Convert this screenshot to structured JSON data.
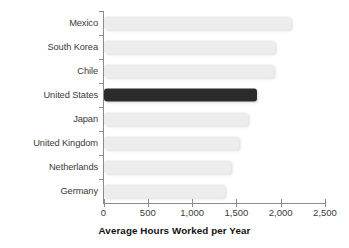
{
  "chart_data": {
    "type": "bar",
    "orientation": "horizontal",
    "title": "",
    "xlabel": "Average Hours Worked per Year",
    "ylabel": "",
    "categories": [
      "Mexico",
      "South Korea",
      "Chile",
      "United States",
      "Japan",
      "United Kingdom",
      "Netherlands",
      "Germany"
    ],
    "values": [
      2105,
      1935,
      1915,
      1730,
      1630,
      1520,
      1430,
      1370
    ],
    "xlim": [
      0,
      2500
    ],
    "xticks": [
      0,
      500,
      1000,
      1500,
      2000,
      2500
    ],
    "xtick_labels": [
      "0",
      "500",
      "1,000",
      "1,500",
      "2,000",
      "2,500"
    ],
    "grid": false,
    "legend": null,
    "highlight_category": "United States",
    "bar_color": "#ededed",
    "highlight_color": "#2b2b2b",
    "axis_color": "#8c8c8c",
    "text_color": "#3a3a3a"
  }
}
